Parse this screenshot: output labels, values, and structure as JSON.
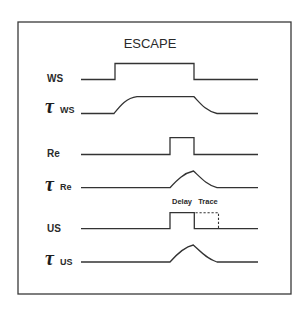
{
  "diagram": {
    "title": "ESCAPE",
    "signals": [
      {
        "id": "ws",
        "label": "WS",
        "tau": false
      },
      {
        "id": "tau-ws",
        "tau_symbol": "τ",
        "label": "WS",
        "tau": true
      },
      {
        "id": "re",
        "label": "Re",
        "tau": false
      },
      {
        "id": "tau-re",
        "tau_symbol": "τ",
        "label": "Re",
        "tau": true
      },
      {
        "id": "us",
        "label": "US",
        "tau": false
      },
      {
        "id": "tau-us",
        "tau_symbol": "τ",
        "label": "US",
        "tau": true
      }
    ],
    "annotations": {
      "delay": "Delay",
      "trace": "Trace"
    },
    "colors": {
      "line": "#333333",
      "frame": "#3a3a3a",
      "background": "#ffffff"
    }
  }
}
